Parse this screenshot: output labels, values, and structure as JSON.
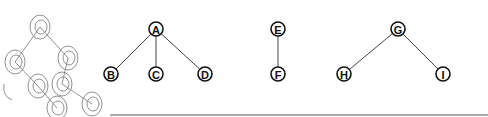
{
  "title": "",
  "trees": [
    {
      "id": "tree-1",
      "nodes": [
        {
          "id": "A",
          "label": "A",
          "x": 156,
          "y": 29
        },
        {
          "id": "B",
          "label": "B",
          "x": 111,
          "y": 74
        },
        {
          "id": "C",
          "label": "C",
          "x": 156,
          "y": 74
        },
        {
          "id": "D",
          "label": "D",
          "x": 205,
          "y": 74
        }
      ],
      "edges": [
        [
          "A",
          "B"
        ],
        [
          "A",
          "C"
        ],
        [
          "A",
          "D"
        ]
      ]
    },
    {
      "id": "tree-2",
      "nodes": [
        {
          "id": "E",
          "label": "E",
          "x": 278,
          "y": 29
        },
        {
          "id": "F",
          "label": "F",
          "x": 278,
          "y": 74
        }
      ],
      "edges": [
        [
          "E",
          "F"
        ]
      ]
    },
    {
      "id": "tree-3",
      "nodes": [
        {
          "id": "G",
          "label": "G",
          "x": 398,
          "y": 29
        },
        {
          "id": "H",
          "label": "H",
          "x": 344,
          "y": 74
        },
        {
          "id": "I",
          "label": "I",
          "x": 443,
          "y": 74
        }
      ],
      "edges": [
        [
          "G",
          "H"
        ],
        [
          "G",
          "I"
        ]
      ]
    }
  ],
  "sketch": {
    "description": "faint hand-drawn tree sketch in left margin",
    "nodes": [
      {
        "label": "a",
        "x": 40,
        "y": 27
      },
      {
        "label": "b",
        "x": 15,
        "y": 62
      },
      {
        "label": "c",
        "x": 68,
        "y": 58
      },
      {
        "label": "",
        "x": 38,
        "y": 86
      },
      {
        "label": "",
        "x": 62,
        "y": 84
      },
      {
        "label": "",
        "x": 57,
        "y": 108
      },
      {
        "label": "",
        "x": 92,
        "y": 104
      }
    ]
  },
  "node_radius": 7,
  "baseline": {
    "x1": 110,
    "x2": 488,
    "y": 115
  }
}
